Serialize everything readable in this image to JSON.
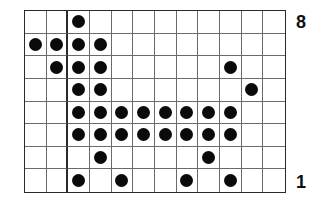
{
  "diagram": {
    "title": "",
    "columns": 12,
    "rows": 8,
    "thick_vertical_after_col": 1,
    "row_labels": {
      "top": "8",
      "bottom": "1"
    },
    "dot_color": "#0a0a0a",
    "grid_line_color": "#6a6a6a",
    "rows_top_to_bottom": [
      {
        "row": 8,
        "filled_cols": [
          2
        ]
      },
      {
        "row": 7,
        "filled_cols": [
          0,
          1,
          2,
          3
        ]
      },
      {
        "row": 6,
        "filled_cols": [
          1,
          2,
          3,
          9
        ]
      },
      {
        "row": 5,
        "filled_cols": [
          2,
          3,
          10
        ]
      },
      {
        "row": 4,
        "filled_cols": [
          2,
          3,
          4,
          5,
          6,
          7,
          8,
          9
        ]
      },
      {
        "row": 3,
        "filled_cols": [
          2,
          3,
          4,
          5,
          6,
          7,
          8,
          9
        ]
      },
      {
        "row": 2,
        "filled_cols": [
          3,
          8
        ]
      },
      {
        "row": 1,
        "filled_cols": [
          2,
          4,
          7,
          9
        ]
      }
    ]
  }
}
